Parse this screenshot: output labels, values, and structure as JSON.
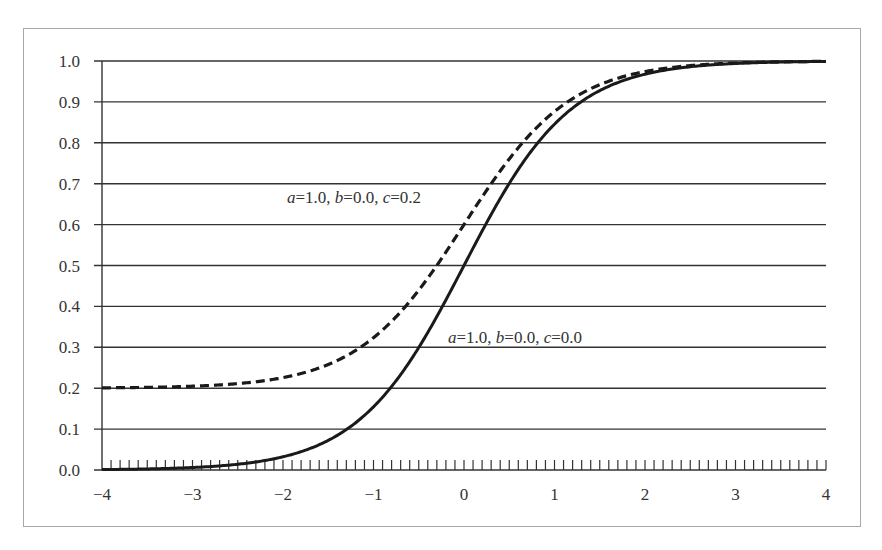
{
  "chart_data": {
    "type": "line",
    "title": "",
    "xlabel": "",
    "ylabel": "",
    "xlim": [
      -4,
      4
    ],
    "ylim": [
      0.0,
      1.0
    ],
    "grid": "horizontal",
    "legend": "none",
    "x_ticks": [
      "−4",
      "−3",
      "−2",
      "−1",
      "0",
      "1",
      "2",
      "3",
      "4"
    ],
    "y_ticks": [
      "0.0",
      "0.1",
      "0.2",
      "0.3",
      "0.4",
      "0.5",
      "0.6",
      "0.7",
      "0.8",
      "0.9",
      "1.0"
    ],
    "minor_x_tick_step": 0.1,
    "x": [
      -4.0,
      -3.5,
      -3.0,
      -2.5,
      -2.0,
      -1.5,
      -1.0,
      -0.5,
      0.0,
      0.5,
      1.0,
      1.5,
      2.0,
      2.5,
      3.0,
      3.5,
      4.0
    ],
    "series": [
      {
        "name": "a=1.0, b=0.0, c=0.0",
        "style": "solid",
        "params": {
          "a": 1.0,
          "b": 0.0,
          "c": 0.0
        },
        "values": [
          0.001,
          0.003,
          0.006,
          0.014,
          0.032,
          0.072,
          0.154,
          0.299,
          0.5,
          0.701,
          0.846,
          0.928,
          0.968,
          0.986,
          0.994,
          0.997,
          0.999
        ]
      },
      {
        "name": "a=1.0, b=0.0, c=0.2",
        "style": "dashed",
        "params": {
          "a": 1.0,
          "b": 0.0,
          "c": 0.2
        },
        "values": [
          0.201,
          0.202,
          0.205,
          0.211,
          0.226,
          0.258,
          0.323,
          0.439,
          0.6,
          0.761,
          0.877,
          0.942,
          0.974,
          0.989,
          0.995,
          0.998,
          0.999
        ]
      }
    ],
    "annotations": [
      {
        "text_parts": [
          [
            "a",
            "i"
          ],
          [
            "=1.0, ",
            ""
          ],
          [
            "b",
            "i"
          ],
          [
            "=0.0, ",
            ""
          ],
          [
            "c",
            "i"
          ],
          [
            "=0.2",
            ""
          ]
        ],
        "x_px": 287,
        "y_px": 203,
        "target": "dashed"
      },
      {
        "text_parts": [
          [
            "a",
            "i"
          ],
          [
            "=1.0, ",
            ""
          ],
          [
            "b",
            "i"
          ],
          [
            "=0.0, ",
            ""
          ],
          [
            "c",
            "i"
          ],
          [
            "=0.0",
            ""
          ]
        ],
        "x_px": 448,
        "y_px": 343,
        "target": "solid"
      }
    ]
  },
  "annotations_text": {
    "dashed_label": "a=1.0, b=0.0, c=0.2",
    "solid_label": "a=1.0, b=0.0, c=0.0"
  }
}
